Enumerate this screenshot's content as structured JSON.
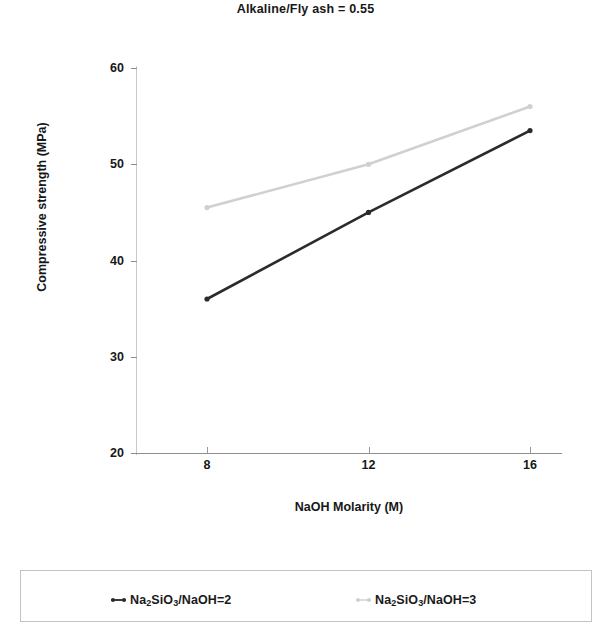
{
  "chart_data": {
    "type": "line",
    "title": "Alkaline/Fly ash = 0.55",
    "xlabel": "NaOH Molarity (M)",
    "ylabel": "Compressive strength (MPa)",
    "x": [
      8,
      12,
      16
    ],
    "xticklabels": [
      "8",
      "12",
      "16"
    ],
    "yticklabels": [
      "20",
      "30",
      "40",
      "50",
      "60"
    ],
    "yticks": [
      20,
      30,
      40,
      50,
      60
    ],
    "xlim": [
      6,
      17.5
    ],
    "ylim": [
      20,
      60
    ],
    "grid": false,
    "legend_position": "below-plot-box",
    "series": [
      {
        "name": "Na2SiO3/NaOH=2",
        "name_html": "Na<sub>2</sub>SiO<sub>3</sub>/NaOH=2",
        "color": "#2b2b2b",
        "values": [
          36,
          45,
          53.5
        ],
        "marker": "dot"
      },
      {
        "name": "Na2SiO3/NaOH=3",
        "name_html": "Na<sub>2</sub>SiO<sub>3</sub>/NaOH=3",
        "color": "#d0d0d0",
        "values": [
          45.5,
          50,
          56
        ],
        "marker": "dot"
      }
    ]
  },
  "chart": {
    "title": "Alkaline/Fly ash = 0.55",
    "x_axis_title": "NaOH Molarity (M)",
    "y_axis_title": "Compressive strength (MPa)"
  },
  "legend": {
    "entries": [
      {
        "label_text": "Na2SiO3/NaOH=2"
      },
      {
        "label_text": "Na2SiO3/NaOH=3"
      }
    ]
  }
}
